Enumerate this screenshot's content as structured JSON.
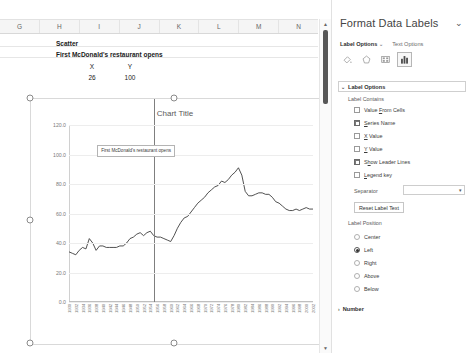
{
  "spreadsheet": {
    "columns": [
      "G",
      "H",
      "I",
      "J",
      "K",
      "L",
      "M",
      "N"
    ],
    "cells": {
      "scatter": "Scatter",
      "note": "First McDonald's restaurant opens",
      "x_header": "X",
      "y_header": "Y",
      "x_value": "26",
      "y_value": "100"
    }
  },
  "chart_data": {
    "type": "line",
    "title": "Chart Title",
    "xlabel": "",
    "ylabel": "",
    "ylim": [
      0,
      120
    ],
    "yticks": [
      "0.0",
      "20.0",
      "40.0",
      "60.0",
      "80.0",
      "100.0",
      "120.0"
    ],
    "grid": true,
    "legend": "none",
    "xticks": [
      "1930",
      "1932",
      "1934",
      "1936",
      "1938",
      "1940",
      "1942",
      "1944",
      "1946",
      "1948",
      "1950",
      "1952",
      "1954",
      "1956",
      "1958",
      "1960",
      "1962",
      "1964",
      "1966",
      "1968",
      "1970",
      "1972",
      "1974",
      "1976",
      "1978",
      "1980",
      "1982",
      "1984",
      "1986",
      "1988",
      "1990",
      "1992",
      "1994",
      "1996",
      "1998",
      "2000",
      "2002"
    ],
    "x": [
      1930,
      1931,
      1932,
      1933,
      1934,
      1935,
      1936,
      1937,
      1938,
      1939,
      1940,
      1941,
      1942,
      1943,
      1944,
      1945,
      1946,
      1947,
      1948,
      1949,
      1950,
      1951,
      1952,
      1953,
      1954,
      1955,
      1956,
      1957,
      1958,
      1959,
      1960,
      1961,
      1962,
      1963,
      1964,
      1965,
      1966,
      1967,
      1968,
      1969,
      1970,
      1971,
      1972,
      1973,
      1974,
      1975,
      1976,
      1977,
      1978,
      1979,
      1980,
      1981,
      1982,
      1983,
      1984,
      1985,
      1986,
      1987,
      1988,
      1989,
      1990,
      1991,
      1992,
      1993,
      1994,
      1995,
      1996,
      1997,
      1998,
      1999,
      2000,
      2001,
      2002
    ],
    "values": [
      34,
      33,
      32,
      35,
      37,
      36,
      43,
      40,
      35,
      38,
      38,
      37,
      37,
      37,
      37,
      38,
      38,
      40,
      43,
      44,
      46,
      47,
      45,
      47,
      48,
      45,
      44,
      44,
      43,
      42,
      41,
      45,
      50,
      54,
      57,
      58,
      61,
      64,
      67,
      69,
      71,
      74,
      76,
      78,
      79,
      82,
      81,
      83,
      86,
      88,
      91,
      86,
      75,
      72,
      72,
      73,
      74,
      74,
      73,
      73,
      71,
      68,
      67,
      65,
      63,
      62,
      62,
      63,
      62,
      63,
      64,
      63,
      63
    ],
    "annotation": {
      "label": "First McDonald's restaurant opens",
      "x": 1955,
      "y": 100
    }
  },
  "pane": {
    "title": "Format Data Labels",
    "close_icon": "chevron-down-icon",
    "tabs": [
      {
        "label": "Label Options",
        "active": true
      },
      {
        "label": "Text Options",
        "active": false
      }
    ],
    "icons": [
      {
        "name": "fill-line-icon",
        "selected": false
      },
      {
        "name": "effects-icon",
        "selected": false
      },
      {
        "name": "size-properties-icon",
        "selected": false
      },
      {
        "name": "label-options-icon",
        "selected": true
      }
    ],
    "sections": {
      "label_options": {
        "header": "Label Options",
        "expanded": true,
        "label_contains_title": "Label Contains",
        "checkboxes": [
          {
            "label": "Value From Cells",
            "checked": false,
            "accel": "F"
          },
          {
            "label": "Series Name",
            "checked": true,
            "accel": "S"
          },
          {
            "label": "X Value",
            "checked": false,
            "accel": "X"
          },
          {
            "label": "Y Value",
            "checked": false,
            "accel": "Y"
          },
          {
            "label": "Show Leader Lines",
            "checked": true,
            "accel": "h"
          },
          {
            "label": "Legend key",
            "checked": false,
            "accel": "L"
          }
        ],
        "separator_label": "Separator",
        "separator_value": "",
        "reset_button": "Reset Label Text",
        "label_position_title": "Label Position",
        "positions": [
          {
            "label": "Center",
            "selected": false
          },
          {
            "label": "Left",
            "selected": true
          },
          {
            "label": "Right",
            "selected": false
          },
          {
            "label": "Above",
            "selected": false
          },
          {
            "label": "Below",
            "selected": false
          }
        ]
      },
      "number": {
        "header": "Number",
        "expanded": false
      }
    }
  },
  "colors": {
    "line": "#3d3d3d",
    "accent": "#7a7a7a",
    "grid": "#ededed",
    "pane_border": "#e1e1e1"
  }
}
